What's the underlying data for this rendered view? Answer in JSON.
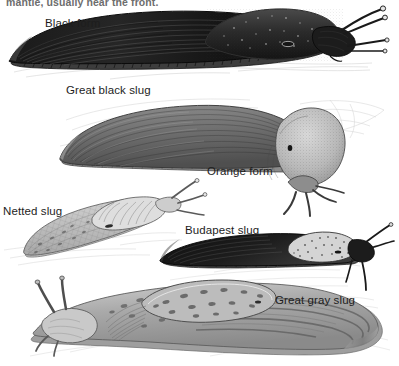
{
  "plate": {
    "title": "Slug species illustration plate",
    "background_color": "#ffffff",
    "ink_color": "#1d1d1d",
    "clipped_body_text": "mantle, usually near the front.",
    "labels": {
      "black_form": "Black form",
      "great_black_slug": "Great black slug",
      "orange_form": "Orange form",
      "netted_slug": "Netted slug",
      "budapest_slug": "Budapest slug",
      "great_gray_slug": "Great gray slug"
    },
    "figures": [
      {
        "name": "great-black-slug-black-form",
        "label": "Black form",
        "common_name": "Great black slug",
        "tone": "very dark / near black",
        "orientation": "head to the right"
      },
      {
        "name": "great-black-slug-orange-form",
        "label": "Orange form",
        "common_name": "Great black slug",
        "tone": "medium gray body with pale stippled mantle",
        "orientation": "head to the right"
      },
      {
        "name": "netted-slug",
        "label": "Netted slug",
        "common_name": "Netted slug",
        "tone": "pale gray with netted reticulate pattern",
        "orientation": "head to the upper right"
      },
      {
        "name": "budapest-slug",
        "label": "Budapest slug",
        "common_name": "Budapest slug",
        "tone": "dark body with pale speckled mantle",
        "orientation": "head to the right"
      },
      {
        "name": "great-gray-slug",
        "label": "Great gray slug",
        "common_name": "Great gray slug",
        "tone": "light gray with dark spots and stripes",
        "orientation": "head to the left"
      }
    ]
  }
}
